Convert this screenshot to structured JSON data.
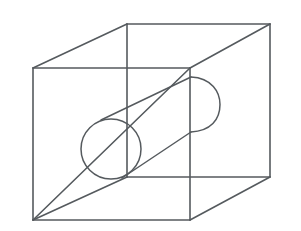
{
  "figure": {
    "background_color": "#ffffff",
    "line_color": "#555a5e",
    "line_width": 1.6,
    "canvas": {
      "width": 301,
      "height": 231
    }
  },
  "cube": {
    "name": "wireframe-cube",
    "projection": "oblique",
    "vertices": {
      "front_top_left": {
        "x": 33,
        "y": 68
      },
      "front_top_right": {
        "x": 190,
        "y": 68
      },
      "front_bottom_left": {
        "x": 33,
        "y": 220
      },
      "front_bottom_right": {
        "x": 190,
        "y": 220
      },
      "back_top_left": {
        "x": 127,
        "y": 24
      },
      "back_top_right": {
        "x": 270,
        "y": 24
      },
      "back_bottom_left": {
        "x": 127,
        "y": 177
      },
      "back_bottom_right": {
        "x": 270,
        "y": 177
      }
    },
    "edges": [
      {
        "name": "front-face-top",
        "from": "front_top_left",
        "to": "front_top_right"
      },
      {
        "name": "front-face-left",
        "from": "front_top_left",
        "to": "front_bottom_left"
      },
      {
        "name": "front-face-right",
        "from": "front_top_right",
        "to": "front_bottom_right"
      },
      {
        "name": "front-face-bottom",
        "from": "front_bottom_left",
        "to": "front_bottom_right"
      },
      {
        "name": "back-face-top",
        "from": "back_top_left",
        "to": "back_top_right"
      },
      {
        "name": "back-face-left",
        "from": "back_top_left",
        "to": "back_bottom_left"
      },
      {
        "name": "back-face-right",
        "from": "back_top_right",
        "to": "back_bottom_right"
      },
      {
        "name": "back-face-bottom",
        "from": "back_bottom_left",
        "to": "back_bottom_right"
      },
      {
        "name": "connector-top-left",
        "from": "front_top_left",
        "to": "back_top_left"
      },
      {
        "name": "connector-top-right",
        "from": "front_top_right",
        "to": "back_top_right"
      },
      {
        "name": "connector-bottom-right",
        "from": "front_bottom_right",
        "to": "back_bottom_right"
      },
      {
        "name": "connector-bottom-left",
        "from": "front_bottom_left",
        "to": "back_bottom_left"
      }
    ]
  },
  "cylinder": {
    "name": "intersecting-cylinder",
    "near_cap": {
      "shape": "circle",
      "center": {
        "x": 111,
        "y": 149
      },
      "radius": 30
    },
    "far_cap": {
      "shape": "arc",
      "start": {
        "x": 191,
        "y": 77
      },
      "end": {
        "x": 191,
        "y": 132
      },
      "bulge_x": 220
    },
    "top_tangent": {
      "from": {
        "x": 101,
        "y": 120
      },
      "to": {
        "x": 191,
        "y": 77
      }
    },
    "bottom_tangent": {
      "from": {
        "x": 122,
        "y": 178
      },
      "to": {
        "x": 191,
        "y": 132
      }
    },
    "axis_angle_deg": -26
  },
  "diagonal": {
    "name": "face-diagonal",
    "from": {
      "x": 33,
      "y": 220
    },
    "to": {
      "x": 190,
      "y": 68
    }
  }
}
